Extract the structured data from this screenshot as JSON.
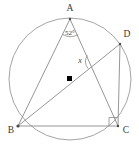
{
  "figure": {
    "type": "geometry-diagram",
    "width": 139,
    "height": 149,
    "background_color": "#ffffff",
    "stroke_color": "#8a8a8a",
    "label_color": "#3a3a3a",
    "center_dot_color": "#000000"
  },
  "circle": {
    "name": "circumscribed-circle",
    "cx": 70,
    "cy": 79,
    "r": 61
  },
  "center_point": {
    "name": "circle-center",
    "x": 70,
    "y": 79,
    "marker": "filled-square"
  },
  "vertices": [
    {
      "id": "A",
      "label": "A",
      "x": 70,
      "y": 19,
      "label_x": 70,
      "label_y": 10
    },
    {
      "id": "D",
      "label": "D",
      "x": 120,
      "y": 44,
      "label_x": 126,
      "label_y": 38
    },
    {
      "id": "B",
      "label": "B",
      "x": 18,
      "y": 126,
      "label_x": 11,
      "label_y": 133
    },
    {
      "id": "C",
      "label": "C",
      "x": 118,
      "y": 126,
      "label_x": 125,
      "label_y": 133
    }
  ],
  "segments": [
    {
      "name": "segment-A-B",
      "from": "A",
      "to": "B"
    },
    {
      "name": "segment-A-C",
      "from": "A",
      "to": "C"
    },
    {
      "name": "segment-B-C",
      "from": "B",
      "to": "C"
    },
    {
      "name": "segment-B-D",
      "from": "B",
      "to": "D"
    },
    {
      "name": "segment-D-C",
      "from": "D",
      "to": "C"
    }
  ],
  "angle_labels": [
    {
      "name": "angle-at-A",
      "text": "52°",
      "value": 52,
      "unit": "degrees",
      "x": 70,
      "y": 34,
      "marker": "arc"
    },
    {
      "name": "angle-x-at-intersection",
      "text": "x",
      "value": null,
      "unit": "degrees",
      "x": 81,
      "y": 62,
      "marker": "arc"
    }
  ],
  "right_angle": {
    "name": "right-angle-at-C",
    "at_vertex": "C",
    "marker": "square",
    "size": 8
  }
}
